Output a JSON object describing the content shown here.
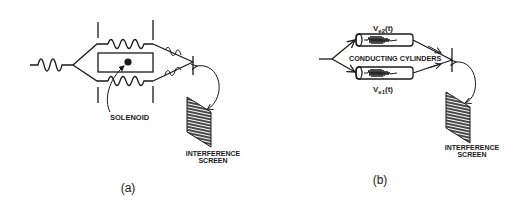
{
  "figure": {
    "panel_a": {
      "caption": "(a)",
      "labels": {
        "solenoid": "SOLENOID",
        "screen_line1": "INTERFERENCE",
        "screen_line2": "SCREEN"
      }
    },
    "panel_b": {
      "caption": "(b)",
      "labels": {
        "cylinders": "CONDUCTING CYLINDERS",
        "v2_main": "V",
        "v2_sub": "e2",
        "v2_arg": "(t)",
        "v1_main": "V",
        "v1_sub": "e1",
        "v1_arg": "(t)",
        "screen_line1": "INTERFERENCE",
        "screen_line2": "SCREEN"
      }
    },
    "colors": {
      "ink": "#1a1a1a",
      "background": "#ffffff"
    }
  }
}
